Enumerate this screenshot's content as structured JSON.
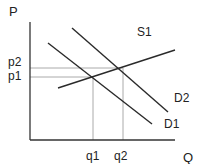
{
  "diagram": {
    "axes": {
      "y_label": "P",
      "x_label": "Q",
      "price_ticks": [
        {
          "label": "p2",
          "y": 68
        },
        {
          "label": "p1",
          "y": 77
        }
      ],
      "quantity_ticks": [
        {
          "label": "q1",
          "x": 93
        },
        {
          "label": "q2",
          "x": 123
        }
      ]
    },
    "curves": [
      {
        "name": "S1",
        "type": "supply",
        "x1": 58,
        "y1": 88,
        "x2": 175,
        "y2": 50
      },
      {
        "name": "D1",
        "type": "demand",
        "x1": 48,
        "y1": 43,
        "x2": 152,
        "y2": 124
      },
      {
        "name": "D2",
        "type": "demand",
        "x1": 72,
        "y1": 28,
        "x2": 168,
        "y2": 112
      }
    ],
    "equilibria": [
      {
        "price": "p1",
        "quantity": "q1"
      },
      {
        "price": "p2",
        "quantity": "q2"
      }
    ],
    "colors": {
      "axis": "#333333",
      "curve": "#2a2a2a",
      "guide": "#aaaaaa",
      "text": "#222222"
    }
  }
}
